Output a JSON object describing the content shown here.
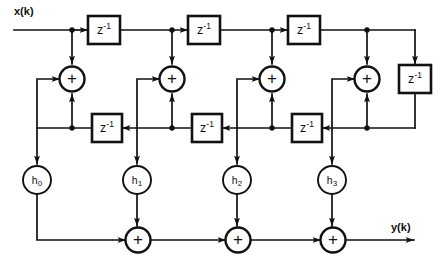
{
  "diagram": {
    "type": "signal-flow-graph",
    "canvas": {
      "width": 443,
      "height": 264
    },
    "background_color": "#ffffff",
    "line_color": "#111111",
    "io": {
      "input_label": "x(k)",
      "output_label": "y(k)"
    },
    "delay_symbol": {
      "base": "z",
      "exponent": "-1"
    },
    "adder_symbol": "+",
    "top_delays": [
      {
        "id": "top-delay-1",
        "label_base": "z",
        "label_exp": "-1"
      },
      {
        "id": "top-delay-2",
        "label_base": "z",
        "label_exp": "-1"
      },
      {
        "id": "top-delay-3",
        "label_base": "z",
        "label_exp": "-1"
      }
    ],
    "right_delay": {
      "id": "right-delay",
      "label_base": "z",
      "label_exp": "-1"
    },
    "feedback_delays": [
      {
        "id": "fb-delay-1",
        "label_base": "z",
        "label_exp": "-1"
      },
      {
        "id": "fb-delay-2",
        "label_base": "z",
        "label_exp": "-1"
      },
      {
        "id": "fb-delay-3",
        "label_base": "z",
        "label_exp": "-1"
      }
    ],
    "sum_nodes": [
      {
        "id": "sum-upper-0",
        "symbol": "+"
      },
      {
        "id": "sum-upper-1",
        "symbol": "+"
      },
      {
        "id": "sum-upper-2",
        "symbol": "+"
      },
      {
        "id": "sum-upper-3",
        "symbol": "+"
      },
      {
        "id": "sum-output-1",
        "symbol": "+"
      },
      {
        "id": "sum-output-2",
        "symbol": "+"
      },
      {
        "id": "sum-output-3",
        "symbol": "+"
      }
    ],
    "coefficients": [
      {
        "id": "coef-h0",
        "base": "h",
        "sub": "0"
      },
      {
        "id": "coef-h1",
        "base": "h",
        "sub": "1"
      },
      {
        "id": "coef-h2",
        "base": "h",
        "sub": "2"
      },
      {
        "id": "coef-h3",
        "base": "h",
        "sub": "3"
      }
    ]
  }
}
